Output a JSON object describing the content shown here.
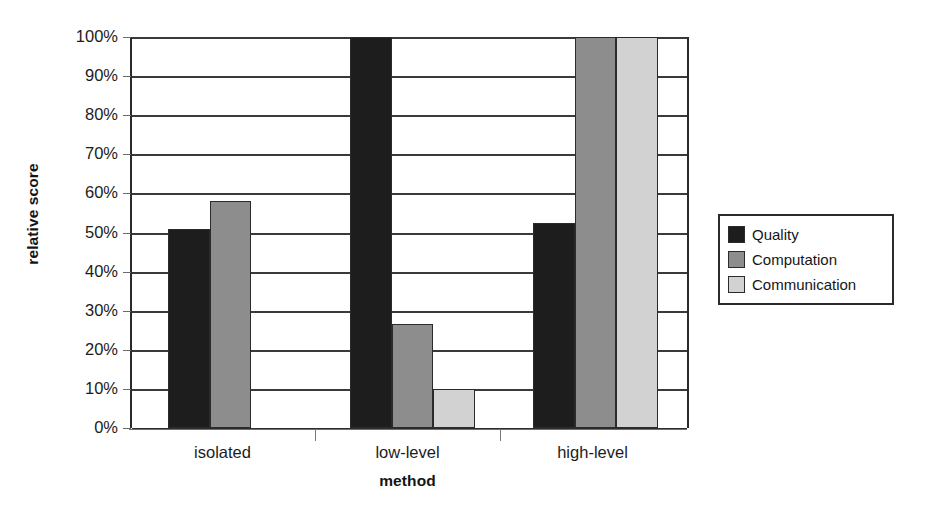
{
  "chart_data": {
    "type": "bar",
    "title": "",
    "xlabel": "method",
    "ylabel": "relative score",
    "categories": [
      "isolated",
      "low-level",
      "high-level"
    ],
    "series": [
      {
        "name": "Quality",
        "color": "#1d1d1d",
        "values": [
          51,
          100,
          52.5
        ]
      },
      {
        "name": "Computation",
        "color": "#8d8d8d",
        "values": [
          58,
          26.5,
          100
        ]
      },
      {
        "name": "Communication",
        "color": "#d2d2d2",
        "values": [
          0,
          10,
          100
        ]
      }
    ],
    "ylim": [
      0,
      100
    ],
    "ytick_labels": [
      "0%",
      "10%",
      "20%",
      "30%",
      "40%",
      "50%",
      "60%",
      "70%",
      "80%",
      "90%",
      "100%"
    ],
    "ytick_values": [
      0,
      10,
      20,
      30,
      40,
      50,
      60,
      70,
      80,
      90,
      100
    ],
    "grid": true,
    "legend_position": "right"
  },
  "legend": {
    "entries": [
      {
        "label": "Quality",
        "color": "#1d1d1d"
      },
      {
        "label": "Computation",
        "color": "#8d8d8d"
      },
      {
        "label": "Communication",
        "color": "#d2d2d2"
      }
    ]
  },
  "colors": {
    "quality": "#1d1d1d",
    "computation": "#8d8d8d",
    "communication": "#d2d2d2",
    "axis": "#2b2b2b",
    "background": "#ffffff"
  }
}
